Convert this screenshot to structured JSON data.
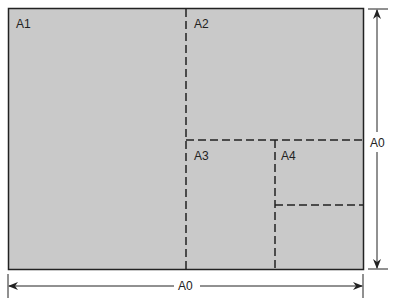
{
  "colors": {
    "sheet": "#c9c9c9",
    "line": "#222222"
  },
  "labels": {
    "a1": "A1",
    "a2": "A2",
    "a3": "A3",
    "a4": "A4",
    "height_dim": "A0",
    "width_dim": "A0"
  }
}
